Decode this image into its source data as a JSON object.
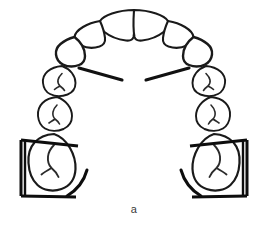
{
  "figure": {
    "caption": "a",
    "background_color": "#ffffff",
    "outline_color": "#1a1a1a",
    "groove_color": "#2a2a2a",
    "bracket_color": "#0d0d0d",
    "watermark_text": "",
    "width": 268,
    "height": 229
  },
  "teeth": {
    "incisor_central_left": {
      "label": "central incisor left",
      "side": "left",
      "type": "incisor"
    },
    "incisor_central_right": {
      "label": "central incisor right",
      "side": "right",
      "type": "incisor"
    },
    "incisor_lateral_left": {
      "label": "lateral incisor left",
      "side": "left",
      "type": "incisor"
    },
    "incisor_lateral_right": {
      "label": "lateral incisor right",
      "side": "right",
      "type": "incisor"
    },
    "canine_left": {
      "label": "canine left",
      "side": "left",
      "type": "canine"
    },
    "canine_right": {
      "label": "canine right",
      "side": "right",
      "type": "canine"
    },
    "premolar_first_left": {
      "label": "first premolar left",
      "side": "left",
      "type": "premolar"
    },
    "premolar_first_right": {
      "label": "first premolar right",
      "side": "right",
      "type": "premolar"
    },
    "premolar_second_left": {
      "label": "second premolar left",
      "side": "left",
      "type": "premolar"
    },
    "premolar_second_right": {
      "label": "second premolar right",
      "side": "right",
      "type": "premolar"
    },
    "molar_first_left": {
      "label": "first molar left",
      "side": "left",
      "type": "molar"
    },
    "molar_first_right": {
      "label": "first molar right",
      "side": "right",
      "type": "molar"
    }
  },
  "annotations": {
    "reference_line_left": {
      "label": "reference line left"
    },
    "reference_line_right": {
      "label": "reference line right"
    },
    "bracket_left": {
      "label": "measurement bracket left molar"
    },
    "bracket_right": {
      "label": "measurement bracket right molar"
    },
    "arc_left": {
      "label": "distal arc left molar"
    },
    "arc_right": {
      "label": "distal arc right molar"
    }
  }
}
